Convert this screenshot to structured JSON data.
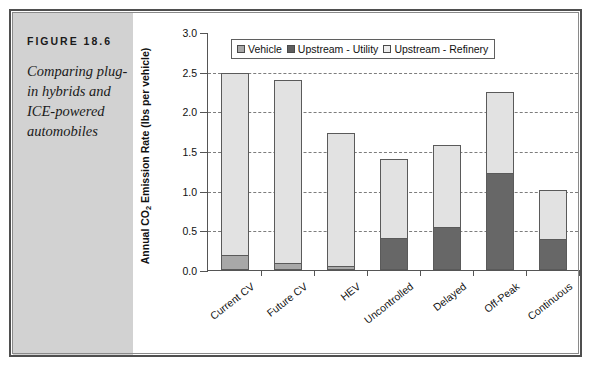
{
  "figure": {
    "number": "FIGURE 18.6",
    "caption": "Comparing plug-in hybrids and ICE-powered automobiles"
  },
  "chart_data": {
    "type": "bar",
    "subtype": "stacked-bar",
    "title": "",
    "xlabel": "",
    "ylabel": "Annual CO2 Emission Rate (lbs per vehicle)",
    "ylabel_parts": {
      "prefix": "Annual CO",
      "sub": "2",
      "suffix": " Emission Rate (lbs per vehicle)"
    },
    "categories": [
      "Current CV",
      "Future CV",
      "HEV",
      "Uncontrolled",
      "Delayed",
      "Off-Peak",
      "Continuous"
    ],
    "series": [
      {
        "name": "Vehicle",
        "color": "#a8a8a8",
        "values": [
          0.17,
          0.07,
          0.03,
          0,
          0,
          0,
          0
        ]
      },
      {
        "name": "Upstream - Utility",
        "color": "#676767",
        "values": [
          0,
          0,
          0,
          0.38,
          0.53,
          1.21,
          0.38
        ]
      },
      {
        "name": "Upstream - Refinery",
        "color": "#e2e2e2",
        "values": [
          2.31,
          2.33,
          1.7,
          1.02,
          1.04,
          1.04,
          0.63
        ]
      }
    ],
    "totals": [
      2.48,
      2.4,
      1.73,
      1.4,
      1.57,
      2.25,
      1.01
    ],
    "ylim": [
      0.0,
      3.0
    ],
    "yticks": [
      "0.0",
      "0.5",
      "1.0",
      "1.5",
      "2.0",
      "2.5",
      "3.0"
    ],
    "ytick_values": [
      0.0,
      0.5,
      1.0,
      1.5,
      2.0,
      2.5,
      3.0
    ],
    "grid": true,
    "grid_axis": "y",
    "legend": [
      "Vehicle",
      "Upstream - Utility",
      "Upstream - Refinery"
    ],
    "legend_position": "top-center-inside"
  }
}
